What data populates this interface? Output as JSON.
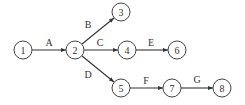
{
  "diagram": {
    "type": "activity-network",
    "nodes": [
      {
        "id": "1",
        "label": "1",
        "x": 23,
        "y": 50
      },
      {
        "id": "2",
        "label": "2",
        "x": 75,
        "y": 50
      },
      {
        "id": "3",
        "label": "3",
        "x": 121,
        "y": 12
      },
      {
        "id": "4",
        "label": "4",
        "x": 127,
        "y": 50
      },
      {
        "id": "5",
        "label": "5",
        "x": 121,
        "y": 88
      },
      {
        "id": "6",
        "label": "6",
        "x": 177,
        "y": 50
      },
      {
        "id": "7",
        "label": "7",
        "x": 172,
        "y": 88
      },
      {
        "id": "8",
        "label": "8",
        "x": 222,
        "y": 88
      }
    ],
    "edges": [
      {
        "from": "1",
        "to": "2",
        "label": "A"
      },
      {
        "from": "2",
        "to": "3",
        "label": "B"
      },
      {
        "from": "2",
        "to": "4",
        "label": "C"
      },
      {
        "from": "2",
        "to": "5",
        "label": "D"
      },
      {
        "from": "4",
        "to": "6",
        "label": "E"
      },
      {
        "from": "5",
        "to": "7",
        "label": "F"
      },
      {
        "from": "7",
        "to": "8",
        "label": "G"
      }
    ]
  }
}
